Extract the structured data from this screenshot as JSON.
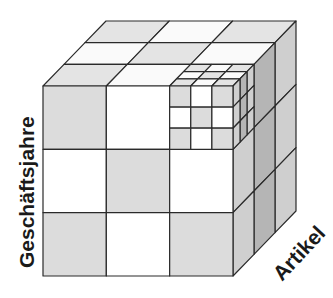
{
  "diagram": {
    "type": "olap-cube",
    "axes": {
      "vertical_label": "Geschäftsjahre",
      "depth_label": "Artikel"
    },
    "grid": {
      "divisions": 3,
      "drilldown_cell": "front-top-right",
      "drilldown_divisions": 3
    },
    "colors": {
      "stroke": "#2a2a2a",
      "front_shaded": "#dcdcdc",
      "front_white": "#ffffff",
      "top_shaded": "#e4e4e4",
      "top_white": "#fafafa",
      "side_light": "#cfcfcf",
      "side_dark": "#b5b5b5"
    }
  }
}
